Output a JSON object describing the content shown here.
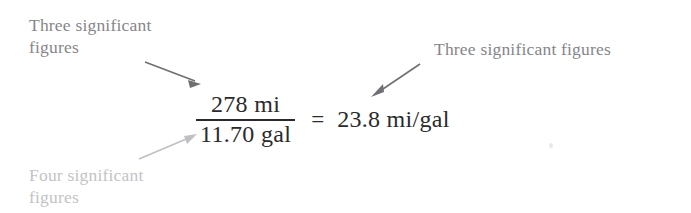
{
  "figure": {
    "background_color": "#ffffff",
    "annotations": {
      "top_left": {
        "text": "Three significant\nfigures",
        "color": "#86868a"
      },
      "top_right": {
        "text": "Three significant figures",
        "color": "#85858a"
      },
      "bottom_left": {
        "text": "Four significant\nfigures",
        "color": "#c3c3c6"
      }
    },
    "equation": {
      "numerator": "278 mi",
      "denominator": "11.70 gal",
      "equals": "=",
      "result": "23.8 mi/gal",
      "color": "#2a2a2c"
    },
    "arrows": [
      {
        "name": "arrow-to-numerator",
        "from": [
          145,
          62
        ],
        "to": [
          201,
          84
        ],
        "color": "#6f6f74",
        "description": "points from top-left label down-right to the numerator 278 mi"
      },
      {
        "name": "arrow-to-result",
        "from": [
          420,
          64
        ],
        "to": [
          371,
          97
        ],
        "color": "#6f6f74",
        "description": "points from top-right label down-left to the result 23.8 mi/gal"
      },
      {
        "name": "arrow-to-denominator",
        "from": [
          139,
          159
        ],
        "to": [
          197,
          134
        ],
        "color": "#c0c0c4",
        "description": "points from bottom-left label up-right to the denominator 11.70 gal"
      }
    ]
  }
}
